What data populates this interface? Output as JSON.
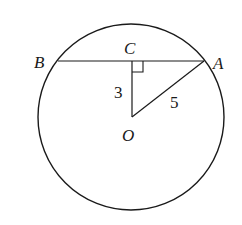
{
  "diagram": {
    "type": "circle-chord-geometry",
    "circle": {
      "center": "O",
      "cx": 131,
      "cy": 117,
      "r": 93
    },
    "points": {
      "A": {
        "label": "A",
        "x": 204,
        "y": 61
      },
      "B": {
        "label": "B",
        "x": 58,
        "y": 61
      },
      "C": {
        "label": "C",
        "x": 132,
        "y": 61
      },
      "O": {
        "label": "O",
        "x": 132,
        "y": 117
      }
    },
    "segments": [
      {
        "from": "B",
        "to": "A",
        "name": "chord-AB"
      },
      {
        "from": "C",
        "to": "O",
        "name": "segment-OC",
        "length_label": "3"
      },
      {
        "from": "O",
        "to": "A",
        "name": "segment-OA",
        "length_label": "5"
      }
    ],
    "right_angle_at": "C",
    "labels": {
      "a": "A",
      "b": "B",
      "c": "C",
      "o": "O",
      "oc_length": "3",
      "oa_length": "5"
    },
    "stroke_color": "#1a1a1a"
  }
}
